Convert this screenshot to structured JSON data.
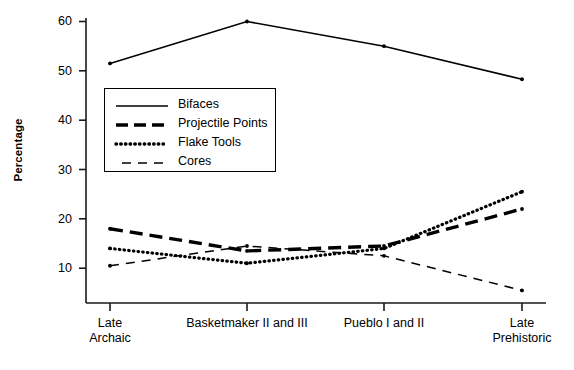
{
  "chart_data": {
    "type": "line",
    "title": "",
    "xlabel": "",
    "ylabel": "Percentage",
    "categories": [
      "Late Archaic",
      "Basketmaker II and III",
      "Pueblo I and II",
      "Late Prehistoric"
    ],
    "category_lines": [
      [
        "Late",
        "Archaic"
      ],
      [
        "Basketmaker II and III"
      ],
      [
        "Pueblo I and II"
      ],
      [
        "Late",
        "Prehistoric"
      ]
    ],
    "ylim": [
      0,
      62
    ],
    "yticks": [
      10,
      20,
      30,
      40,
      50,
      60
    ],
    "ytick_labels": [
      "10",
      "20",
      "30",
      "40",
      "50",
      "60"
    ],
    "grid": false,
    "legend_position": "upper-left-inside",
    "series": [
      {
        "name": "Bifaces",
        "style": "solid",
        "values": [
          51.5,
          60.0,
          55.0,
          48.3
        ]
      },
      {
        "name": "Projectile Points",
        "style": "dashed-thick",
        "values": [
          18.0,
          13.5,
          14.5,
          22.0
        ]
      },
      {
        "name": "Flake Tools",
        "style": "dotted",
        "values": [
          14.0,
          11.0,
          14.0,
          25.5
        ]
      },
      {
        "name": "Cores",
        "style": "dashed-thin",
        "values": [
          10.5,
          14.5,
          12.5,
          5.5
        ]
      }
    ]
  },
  "legend": {
    "entries": [
      {
        "label": "Bifaces",
        "key": "solid-line-key"
      },
      {
        "label": "Projectile Points",
        "key": "thick-dashed-line-key"
      },
      {
        "label": "Flake Tools",
        "key": "dotted-line-key"
      },
      {
        "label": "Cores",
        "key": "thin-dashed-line-key"
      }
    ]
  }
}
